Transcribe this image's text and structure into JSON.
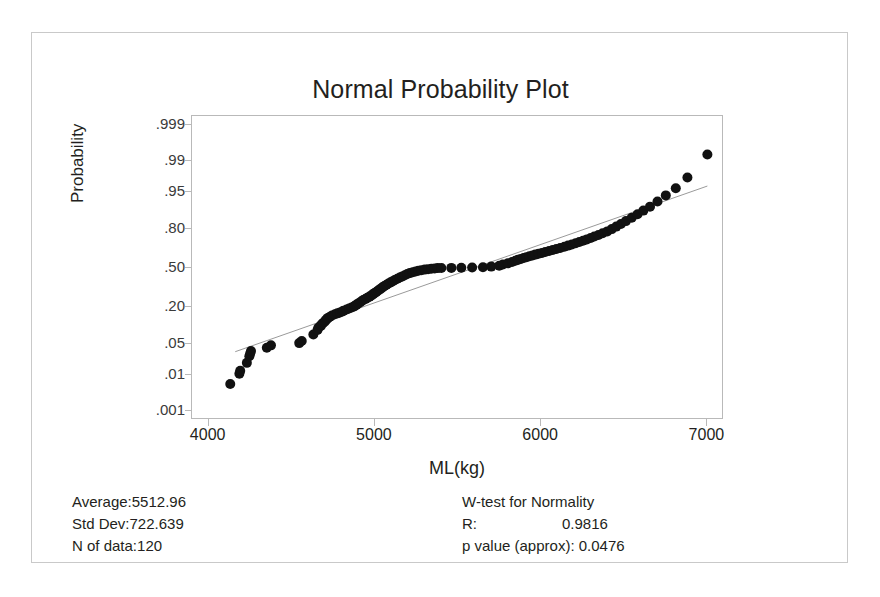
{
  "figure": {
    "title": "Normal Probability Plot"
  },
  "axes": {
    "y_title": "Probability",
    "x_title": "ML(kg)"
  },
  "stats_left": [
    {
      "key": "Average:",
      "value": "5512.96"
    },
    {
      "key": "Std Dev:",
      "value": "722.639"
    },
    {
      "key": "N of data:",
      "value": "120"
    }
  ],
  "stats_right": {
    "heading": "W-test for Normality",
    "r_key": "R:",
    "r_value": "0.9816",
    "p_key": "p value (approx):",
    "p_value": "0.0476"
  },
  "chart_data": {
    "type": "scatter",
    "subtype": "normal-probability-plot",
    "title": "Normal Probability Plot",
    "xlabel": "ML(kg)",
    "ylabel": "Probability",
    "grid": false,
    "legend": null,
    "xlim": [
      3900,
      7100
    ],
    "xticks": [
      4000,
      5000,
      6000,
      7000
    ],
    "xtick_labels": [
      "4000",
      "5000",
      "6000",
      "7000"
    ],
    "ylim_probability": [
      0.0005,
      0.9995
    ],
    "yticks": [
      0.999,
      0.99,
      0.95,
      0.8,
      0.5,
      0.2,
      0.05,
      0.01,
      0.001
    ],
    "ytick_labels": [
      ".999",
      ".99",
      ".95",
      ".80",
      ".50",
      ".20",
      ".05",
      ".01",
      ".001"
    ],
    "y_scale": "normal-quantile",
    "marker": {
      "shape": "circle",
      "color": "#111111",
      "size": 5
    },
    "reference_line": {
      "color": "#9a9a9a",
      "width": 1,
      "x": [
        4160,
        7000
      ],
      "probability": [
        0.035,
        0.962
      ]
    },
    "summary": {
      "average": 5512.96,
      "std_dev": 722.639,
      "n": 120,
      "w_test_R": 0.9816,
      "p_value_approx": 0.0476
    },
    "x": [
      4130,
      4185,
      4190,
      4230,
      4245,
      4250,
      4255,
      4350,
      4375,
      4545,
      4560,
      4630,
      4655,
      4660,
      4675,
      4680,
      4690,
      4700,
      4705,
      4712,
      4718,
      4730,
      4742,
      4760,
      4775,
      4790,
      4805,
      4812,
      4830,
      4845,
      4860,
      4875,
      4880,
      4890,
      4900,
      4910,
      4920,
      4930,
      4945,
      4955,
      4968,
      4980,
      4990,
      5000,
      5010,
      5020,
      5030,
      5040,
      5048,
      5058,
      5070,
      5082,
      5095,
      5108,
      5120,
      5135,
      5150,
      5165,
      5180,
      5195,
      5210,
      5228,
      5245,
      5262,
      5280,
      5300,
      5320,
      5340,
      5360,
      5378,
      5400,
      5460,
      5520,
      5585,
      5650,
      5700,
      5748,
      5770,
      5800,
      5825,
      5845,
      5860,
      5878,
      5895,
      5912,
      5930,
      5948,
      5965,
      5985,
      6005,
      6025,
      6048,
      6070,
      6092,
      6115,
      6140,
      6162,
      6185,
      6208,
      6230,
      6252,
      6275,
      6298,
      6320,
      6345,
      6370,
      6398,
      6425,
      6452,
      6480,
      6510,
      6545,
      6580,
      6615,
      6655,
      6700,
      6750,
      6810,
      6880,
      7000
    ],
    "probability": [
      0.006,
      0.011,
      0.013,
      0.02,
      0.028,
      0.032,
      0.036,
      0.042,
      0.047,
      0.052,
      0.057,
      0.075,
      0.09,
      0.098,
      0.105,
      0.112,
      0.118,
      0.124,
      0.13,
      0.135,
      0.14,
      0.146,
      0.152,
      0.158,
      0.163,
      0.168,
      0.173,
      0.178,
      0.184,
      0.19,
      0.196,
      0.202,
      0.207,
      0.214,
      0.221,
      0.228,
      0.236,
      0.244,
      0.252,
      0.26,
      0.268,
      0.277,
      0.286,
      0.295,
      0.304,
      0.313,
      0.322,
      0.331,
      0.34,
      0.349,
      0.358,
      0.368,
      0.378,
      0.388,
      0.398,
      0.408,
      0.418,
      0.428,
      0.438,
      0.448,
      0.456,
      0.464,
      0.47,
      0.476,
      0.481,
      0.486,
      0.49,
      0.493,
      0.496,
      0.499,
      0.5,
      0.501,
      0.502,
      0.504,
      0.506,
      0.512,
      0.52,
      0.53,
      0.54,
      0.552,
      0.562,
      0.57,
      0.578,
      0.586,
      0.593,
      0.6,
      0.607,
      0.614,
      0.621,
      0.628,
      0.636,
      0.644,
      0.652,
      0.66,
      0.668,
      0.677,
      0.686,
      0.695,
      0.704,
      0.713,
      0.722,
      0.732,
      0.742,
      0.752,
      0.763,
      0.774,
      0.786,
      0.8,
      0.815,
      0.83,
      0.845,
      0.862,
      0.878,
      0.893,
      0.908,
      0.925,
      0.942,
      0.958,
      0.975,
      0.993
    ]
  }
}
